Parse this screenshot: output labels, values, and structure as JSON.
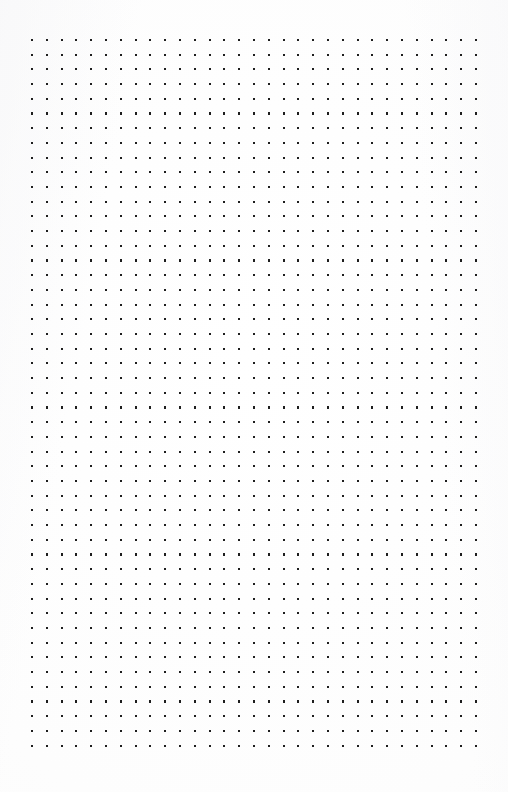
{
  "page": {
    "width": 508,
    "height": 792,
    "background_color": "#fdfdfd",
    "content_text": ""
  },
  "dot_grid": {
    "name": "dot-grid",
    "columns": 31,
    "rows": 49,
    "origin_x": 32,
    "origin_y": 40,
    "spacing_x": 14.8,
    "spacing_y": 14.7,
    "dot_size": 2.1,
    "dot_shape": "square",
    "dot_color": "#1e1e1e",
    "total_dots": 1519,
    "extent_x_end": 476,
    "extent_y_end": 745,
    "margin_left": 32,
    "margin_right": 32,
    "margin_top": 40,
    "margin_bottom": 47
  }
}
